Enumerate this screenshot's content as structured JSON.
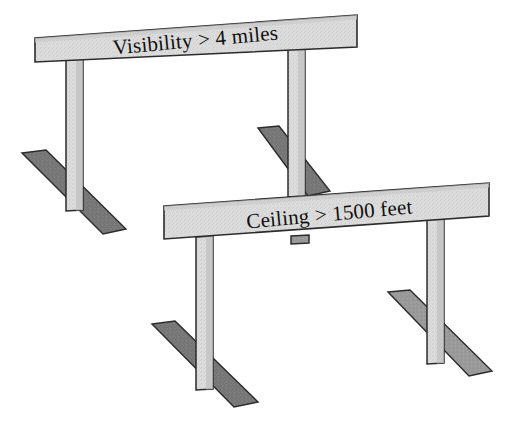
{
  "figure": {
    "type": "diagram",
    "background_color": "#ffffff",
    "outline_color": "#2b2b2b"
  },
  "palette": {
    "bar_light": "#dcdcdc",
    "bar_light_top": "#c9c9c9",
    "post_light": "#dedede",
    "post_shade": "#c2c2c2",
    "foot_dark": "#787878",
    "foot_mid": "#9a9a9a",
    "foot_edge_dark": "#6a6a6a",
    "outline": "#2b2b2b"
  },
  "hurdles": [
    {
      "id": "hurdle-visibility",
      "label": "Visibility > 4 miles",
      "label_x": 196,
      "label_y": 47,
      "label_rotation": -5.2,
      "order": "back",
      "crossbar": {
        "points": "35,38 357,15 357,47 35,62",
        "top_points": "35,38 357,15 357,19 35,42"
      },
      "posts": [
        {
          "name": "left-post",
          "points": "66,60 83,59 83,210 66,211",
          "shade_points": "76,59.5 83,59 83,210 76,210.5"
        },
        {
          "name": "right-post",
          "points": "288,44 305,43 305,196 288,197",
          "shade_points": "298,43.5 305,43 305,196 298,196.5"
        },
        {
          "name": "right-post-stub",
          "points": "291,236 308,236 308,244 291,244",
          "shade_points": "302,236 308,236 308,244 302,244"
        }
      ],
      "feet": [
        {
          "name": "left-foot",
          "points": "22,153 46,150 126,229 103,234",
          "tone": "dark"
        },
        {
          "name": "right-foot",
          "points": "258,128 279,126 330,191 308,196",
          "tone": "dark"
        }
      ]
    },
    {
      "id": "hurdle-ceiling",
      "label": "Ceiling > 1500 feet",
      "label_x": 330,
      "label_y": 221,
      "label_rotation": -5.2,
      "order": "front",
      "crossbar": {
        "points": "164,206 489,183 489,216 164,239",
        "top_points": "164,206 489,183 489,187 164,210"
      },
      "posts": [
        {
          "name": "left-post",
          "points": "196,237 213,236 213,389 196,390",
          "shade_points": "206,236.5 213,236 213,389 206,389.5"
        },
        {
          "name": "right-post",
          "points": "427,212 444,211 444,363 427,364",
          "shade_points": "437,211.5 444,211 444,363 437,363.5"
        }
      ],
      "feet": [
        {
          "name": "left-foot",
          "points": "152,324 175,321 258,402 234,407",
          "tone": "dark"
        },
        {
          "name": "right-foot",
          "points": "388,292 410,290 492,371 469,376",
          "tone": "mid"
        }
      ]
    }
  ]
}
